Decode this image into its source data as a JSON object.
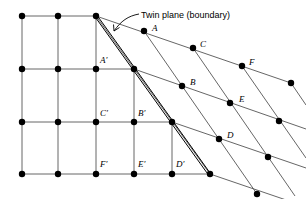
{
  "figure": {
    "name": "twin-boundary-lattice-diagram",
    "callout": {
      "text": "Twin plane (boundary)",
      "x": 141,
      "y": 16
    },
    "colors": {
      "line": "#555555",
      "twin": "#000000",
      "atom": "#000000",
      "text": "#000000"
    },
    "geometry": {
      "twin_plane": {
        "x1": 96,
        "y1": 16,
        "x2": 210,
        "y2": 175
      },
      "leader": {
        "path": "M 139 15 C 128 17 121 21 114 30",
        "arrow": "M 114 30 L 112 25 M 114 30 L 118 27"
      }
    },
    "left_lattice": {
      "name": "orthogonal-grid",
      "cols_x": [
        22,
        58,
        95,
        133,
        171
      ],
      "rows_y": [
        16,
        69,
        122,
        174
      ]
    },
    "right_lattice": {
      "name": "twinned-sheared-grid"
    },
    "atoms_left": [
      {
        "x": 22,
        "y": 16
      },
      {
        "x": 58,
        "y": 16
      },
      {
        "x": 96,
        "y": 16
      },
      {
        "x": 22,
        "y": 69
      },
      {
        "x": 58,
        "y": 69
      },
      {
        "x": 96,
        "y": 69
      },
      {
        "x": 134,
        "y": 69
      },
      {
        "x": 22,
        "y": 122
      },
      {
        "x": 58,
        "y": 122
      },
      {
        "x": 96,
        "y": 122
      },
      {
        "x": 134,
        "y": 122
      },
      {
        "x": 172,
        "y": 122
      },
      {
        "x": 22,
        "y": 174
      },
      {
        "x": 58,
        "y": 174
      },
      {
        "x": 96,
        "y": 174
      },
      {
        "x": 134,
        "y": 174
      },
      {
        "x": 172,
        "y": 174
      },
      {
        "x": 210,
        "y": 174
      }
    ],
    "atoms_right": [
      {
        "x": 144,
        "y": 31
      },
      {
        "x": 193,
        "y": 48
      },
      {
        "x": 242,
        "y": 66
      },
      {
        "x": 182,
        "y": 86
      },
      {
        "x": 230,
        "y": 103
      },
      {
        "x": 279,
        "y": 121
      },
      {
        "x": 219,
        "y": 139
      },
      {
        "x": 268,
        "y": 157
      },
      {
        "x": 257,
        "y": 194
      }
    ],
    "labels_right": [
      {
        "id": "A",
        "text": "A",
        "x": 152,
        "y": 31
      },
      {
        "id": "C",
        "text": "C",
        "x": 200,
        "y": 47
      },
      {
        "id": "F",
        "text": "F",
        "x": 249,
        "y": 65
      },
      {
        "id": "B",
        "text": "B",
        "x": 190,
        "y": 85
      },
      {
        "id": "E",
        "text": "E",
        "x": 239,
        "y": 102
      },
      {
        "id": "D",
        "text": "D",
        "x": 227,
        "y": 138
      }
    ],
    "labels_left": [
      {
        "id": "A-prime",
        "text": "A′",
        "x": 100,
        "y": 63
      },
      {
        "id": "C-prime",
        "text": "C′",
        "x": 100,
        "y": 116
      },
      {
        "id": "B-prime",
        "text": "B′",
        "x": 138,
        "y": 116
      },
      {
        "id": "F-prime",
        "text": "F′",
        "x": 100,
        "y": 167
      },
      {
        "id": "E-prime",
        "text": "E′",
        "x": 138,
        "y": 167
      },
      {
        "id": "D-prime",
        "text": "D′",
        "x": 176,
        "y": 167
      }
    ]
  }
}
